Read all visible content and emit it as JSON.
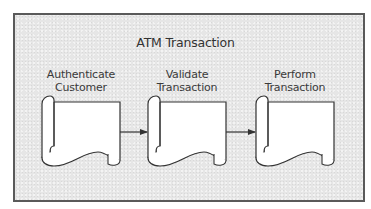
{
  "diagram": {
    "title": "ATM Transaction",
    "steps": [
      {
        "line1": "Authenticate",
        "line2": "Customer",
        "shape": "document-scroll"
      },
      {
        "line1": "Validate",
        "line2": "Transaction",
        "shape": "document-scroll"
      },
      {
        "line1": "Perform",
        "line2": "Transaction",
        "shape": "document-scroll"
      }
    ],
    "connections": [
      {
        "from": "Authenticate Customer",
        "to": "Validate Transaction"
      },
      {
        "from": "Validate Transaction",
        "to": "Perform Transaction"
      }
    ],
    "colors": {
      "frame_border": "#5a5a5a",
      "frame_fill": "#e6e6e6",
      "shape_fill": "#ffffff",
      "stroke": "#333333"
    }
  }
}
